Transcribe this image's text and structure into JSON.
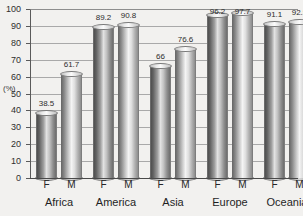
{
  "chart_data": {
    "type": "bar",
    "title": "",
    "xlabel": "",
    "ylabel": "(%)",
    "ylim": [
      0,
      100
    ],
    "ytick_step": 10,
    "yticks": [
      0,
      10,
      20,
      30,
      40,
      50,
      60,
      70,
      80,
      90,
      100
    ],
    "grid": true,
    "legend": "none",
    "categories": [
      "Africa",
      "America",
      "Asia",
      "Europe",
      "Oceania"
    ],
    "subcategories": [
      "F",
      "M"
    ],
    "series": [
      {
        "name": "F",
        "values": [
          38.5,
          89.2,
          66,
          96.2,
          91.1
        ]
      },
      {
        "name": "M",
        "values": [
          61.7,
          90.8,
          76.6,
          97.7,
          92.5
        ]
      }
    ],
    "bars": [
      {
        "group": "Africa",
        "sex": "F",
        "value": 38.5,
        "label": "38.5"
      },
      {
        "group": "Africa",
        "sex": "M",
        "value": 61.7,
        "label": "61.7"
      },
      {
        "group": "America",
        "sex": "F",
        "value": 89.2,
        "label": "89.2"
      },
      {
        "group": "America",
        "sex": "M",
        "value": 90.8,
        "label": "90.8"
      },
      {
        "group": "Asia",
        "sex": "F",
        "value": 66,
        "label": "66"
      },
      {
        "group": "Asia",
        "sex": "M",
        "value": 76.6,
        "label": "76.6"
      },
      {
        "group": "Europe",
        "sex": "F",
        "value": 96.2,
        "label": "96.2"
      },
      {
        "group": "Europe",
        "sex": "M",
        "value": 97.7,
        "label": "97.7"
      },
      {
        "group": "Oceania",
        "sex": "F",
        "value": 91.1,
        "label": "91.1"
      },
      {
        "group": "Oceania",
        "sex": "M",
        "value": 92.5,
        "label": "92.5"
      }
    ],
    "colors": {
      "background": "#f2f1ef",
      "bar_light": "#f4f4f4",
      "bar_dark": "#4f4f4f",
      "gridline": "#a9a9a9",
      "axis": "#5a5a5a",
      "text": "#2b2b2b"
    }
  }
}
